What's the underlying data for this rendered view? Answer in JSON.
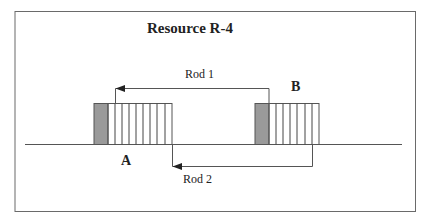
{
  "title": "Resource R-4",
  "labels": {
    "rod1": "Rod 1",
    "rod2": "Rod 2",
    "point_a": "A",
    "point_b": "B"
  },
  "colors": {
    "frame": "#6a6a6a",
    "line": "#555555",
    "block_fill": "#9a9a9a",
    "stripes": "#444444"
  }
}
